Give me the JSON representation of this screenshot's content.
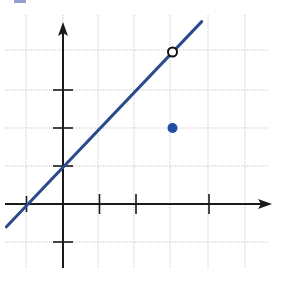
{
  "chart_data": {
    "type": "line",
    "title": "",
    "xlabel": "",
    "ylabel": "",
    "xlim": [
      -1.5,
      5.6
    ],
    "ylim": [
      -1.7,
      4.9
    ],
    "grid": true,
    "unit_ticks": {
      "x": [
        1,
        2,
        4
      ],
      "y": [
        -1,
        1,
        2,
        3
      ]
    },
    "series": [
      {
        "name": "line y = x + 1",
        "kind": "line",
        "color": "#2b4a8c",
        "x": [
          -1.55,
          3.8
        ],
        "y": [
          -0.6,
          4.8
        ],
        "equation": "y = x + 1"
      },
      {
        "name": "open point",
        "kind": "point",
        "style": "open",
        "x": 3,
        "y": 4
      },
      {
        "name": "closed point",
        "kind": "point",
        "style": "filled",
        "color": "#1f4ea3",
        "x": 3,
        "y": 2
      }
    ]
  },
  "colors": {
    "grid": "#c8c8c8",
    "axis": "#1a1a1a",
    "line": "#2b4a8c",
    "dot": "#1f4ea3"
  },
  "layout": {
    "origin_px": [
      63,
      204
    ],
    "unit_px_x": 36.5,
    "unit_px_y": 38,
    "grid_x_px": [
      26,
      63,
      98,
      134,
      170,
      208,
      245
    ],
    "grid_y_px": [
      50,
      90,
      128,
      166,
      204,
      242
    ],
    "grid_bounds": {
      "left": 5,
      "right": 268,
      "top": 15,
      "bottom": 268
    }
  }
}
